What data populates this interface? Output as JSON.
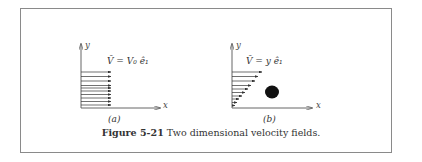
{
  "figure": {
    "caption_label": "Figure 5-21",
    "caption_text": "Two dimensional velocity fields.",
    "panel_a": {
      "label": "(a)",
      "equation": "V̄ = V₀ ê₁",
      "x_axis": "x",
      "y_axis": "y",
      "arrow_count": 10
    },
    "panel_b": {
      "label": "(b)",
      "equation": "V̄ = y ê₁",
      "x_axis": "x",
      "y_axis": "y",
      "arrow_count": 10
    }
  }
}
